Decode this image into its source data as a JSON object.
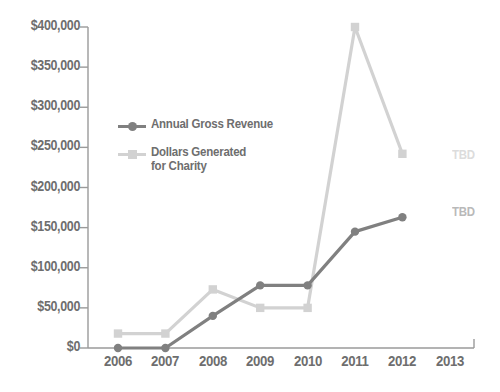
{
  "chart_data": {
    "type": "line",
    "title": "",
    "xlabel": "",
    "ylabel": "",
    "x": [
      "2006",
      "2007",
      "2008",
      "2009",
      "2010",
      "2011",
      "2012",
      "2013"
    ],
    "categories": [
      "2006",
      "2007",
      "2008",
      "2009",
      "2010",
      "2011",
      "2012",
      "2013"
    ],
    "series": [
      {
        "name": "Annual Gross Revenue",
        "color": "#808080",
        "marker": "circle",
        "values": [
          0,
          0,
          40000,
          78000,
          78000,
          145000,
          163000,
          null
        ],
        "missing_label": "TBD"
      },
      {
        "name": "Dollars Generated for Charity",
        "color": "#d2d2d2",
        "marker": "square",
        "values": [
          18000,
          18000,
          73000,
          50000,
          50000,
          400000,
          242000,
          null
        ],
        "missing_label": "TBD"
      }
    ],
    "ylim": [
      0,
      400000
    ],
    "ytick_values": [
      0,
      50000,
      100000,
      150000,
      200000,
      250000,
      300000,
      350000,
      400000
    ],
    "ytick_labels": [
      "$0",
      "$50,000",
      "$100,000",
      "$150,000",
      "$200,000",
      "$250,000",
      "$300,000",
      "$350,000",
      "$400,000"
    ],
    "grid": false,
    "legend_position": "inside-upper-left"
  },
  "legend": {
    "items": [
      {
        "label": "Annual Gross Revenue",
        "color": "#808080",
        "marker": "circle"
      },
      {
        "label": "Dollars Generated\nfor Charity",
        "color": "#d2d2d2",
        "marker": "square"
      }
    ]
  },
  "annotations": [
    {
      "text": "TBD",
      "color": "#dcdcdc",
      "series": "Dollars Generated for Charity",
      "at_x": "2013"
    },
    {
      "text": "TBD",
      "color": "#b9b9b9",
      "series": "Annual Gross Revenue",
      "at_x": "2013"
    }
  ],
  "axis": {
    "color": "#9a9a9a",
    "tick_color": "#9a9a9a"
  }
}
